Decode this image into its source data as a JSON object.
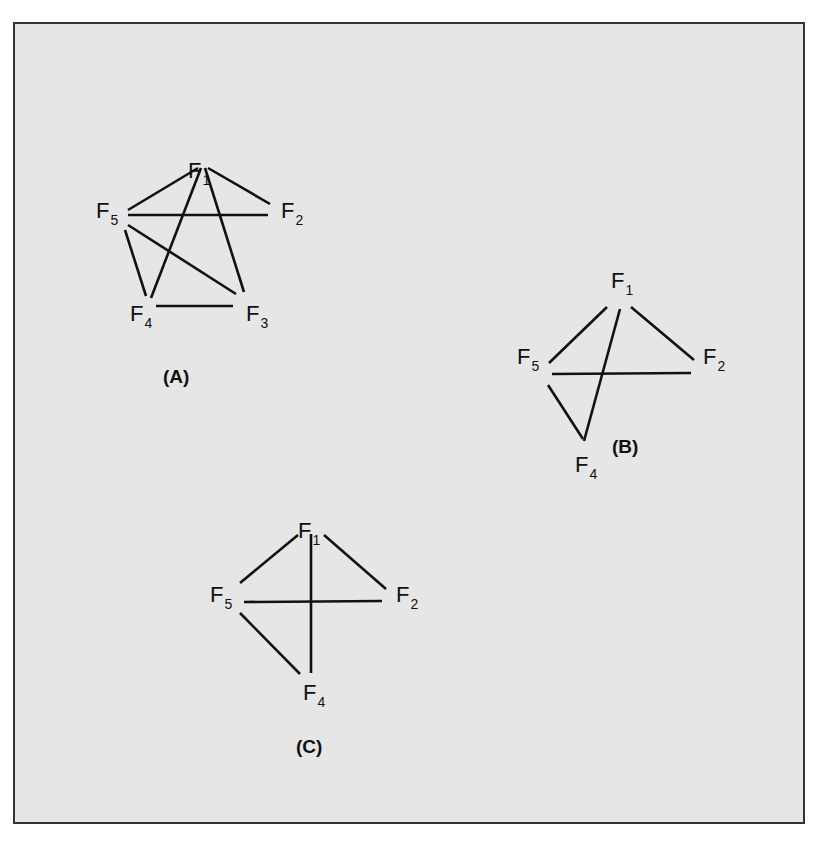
{
  "figure": {
    "background_color": "#e6e6e6",
    "border_color": "#333333",
    "line_color": "#111111"
  },
  "panels": [
    {
      "id": "A",
      "label": "(A)",
      "label_pos": [
        163,
        383
      ],
      "nodes": [
        {
          "id": "F1",
          "letter": "F",
          "sub": "1",
          "pos": [
            188,
            178
          ]
        },
        {
          "id": "F2",
          "letter": "F",
          "sub": "2",
          "pos": [
            281,
            218
          ]
        },
        {
          "id": "F3",
          "letter": "F",
          "sub": "3",
          "pos": [
            246,
            321
          ]
        },
        {
          "id": "F4",
          "letter": "F",
          "sub": "4",
          "pos": [
            130,
            321
          ]
        },
        {
          "id": "F5",
          "letter": "F",
          "sub": "5",
          "pos": [
            96,
            218
          ]
        }
      ],
      "edges": [
        {
          "from": "F1",
          "to": "F5",
          "coords": [
            198,
            168,
            128,
            210
          ]
        },
        {
          "from": "F1",
          "to": "F2",
          "coords": [
            208,
            168,
            270,
            204
          ]
        },
        {
          "from": "F1",
          "to": "F4",
          "coords": [
            201,
            168,
            151,
            298
          ]
        },
        {
          "from": "F1",
          "to": "F3",
          "coords": [
            205,
            168,
            244,
            292
          ]
        },
        {
          "from": "F5",
          "to": "F2",
          "coords": [
            128,
            215,
            268,
            215
          ]
        },
        {
          "from": "F5",
          "to": "F4",
          "coords": [
            125,
            230,
            146,
            296
          ]
        },
        {
          "from": "F5",
          "to": "F3",
          "coords": [
            128,
            225,
            236,
            294
          ]
        },
        {
          "from": "F4",
          "to": "F3",
          "coords": [
            156,
            306,
            233,
            306
          ]
        }
      ]
    },
    {
      "id": "B",
      "label": "(B)",
      "label_pos": [
        612,
        453
      ],
      "nodes": [
        {
          "id": "F1",
          "letter": "F",
          "sub": "1",
          "pos": [
            611,
            288
          ]
        },
        {
          "id": "F2",
          "letter": "F",
          "sub": "2",
          "pos": [
            703,
            364
          ]
        },
        {
          "id": "F4",
          "letter": "F",
          "sub": "4",
          "pos": [
            575,
            472
          ]
        },
        {
          "id": "F5",
          "letter": "F",
          "sub": "5",
          "pos": [
            517,
            364
          ]
        }
      ],
      "edges": [
        {
          "from": "F1",
          "to": "F5",
          "coords": [
            607,
            307,
            549,
            363
          ]
        },
        {
          "from": "F1",
          "to": "F2",
          "coords": [
            631,
            307,
            694,
            360
          ]
        },
        {
          "from": "F1",
          "to": "F4",
          "coords": [
            620,
            309,
            584,
            441
          ]
        },
        {
          "from": "F5",
          "to": "F2",
          "coords": [
            552,
            374,
            691,
            373
          ]
        },
        {
          "from": "F5",
          "to": "F4",
          "coords": [
            548,
            385,
            583,
            439
          ]
        }
      ]
    },
    {
      "id": "C",
      "label": "(C)",
      "label_pos": [
        296,
        753
      ],
      "nodes": [
        {
          "id": "F1",
          "letter": "F",
          "sub": "1",
          "pos": [
            298,
            538
          ]
        },
        {
          "id": "F2",
          "letter": "F",
          "sub": "2",
          "pos": [
            396,
            602
          ]
        },
        {
          "id": "F4",
          "letter": "F",
          "sub": "4",
          "pos": [
            303,
            700
          ]
        },
        {
          "id": "F5",
          "letter": "F",
          "sub": "5",
          "pos": [
            210,
            602
          ]
        }
      ],
      "edges": [
        {
          "from": "F1",
          "to": "F5",
          "coords": [
            298,
            535,
            240,
            583
          ]
        },
        {
          "from": "F1",
          "to": "F2",
          "coords": [
            324,
            535,
            386,
            589
          ]
        },
        {
          "from": "F1",
          "to": "F4",
          "coords": [
            311,
            534,
            311,
            673
          ]
        },
        {
          "from": "F5",
          "to": "F2",
          "coords": [
            244,
            602,
            382,
            601
          ]
        },
        {
          "from": "F5",
          "to": "F4",
          "coords": [
            240,
            613,
            300,
            674
          ]
        }
      ]
    }
  ]
}
